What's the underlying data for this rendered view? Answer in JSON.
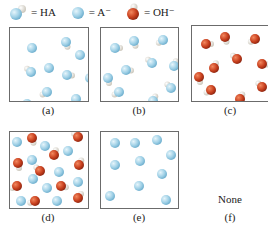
{
  "legend": [
    {
      "symbol": "HA",
      "label": "= HA",
      "icon": "ha-molecule-icon"
    },
    {
      "symbol": "A-",
      "label": "= A⁻",
      "icon": "a-minus-ion-icon"
    },
    {
      "symbol": "OH-",
      "label": "= OH⁻",
      "icon": "hydroxide-ion-icon"
    }
  ],
  "colors": {
    "blue_ion": "#9fd0e6",
    "blue_edge": "#6fb0cf",
    "red_ion": "#c8401e",
    "hydrogen": "#e8e4dc",
    "border": "#6b6b6b"
  },
  "panels": [
    {
      "id": "a",
      "caption": "(a)",
      "contents": "HA molecules and A- ions (mostly HA)",
      "particles": [
        {
          "type": "A-",
          "x": 22,
          "y": 20
        },
        {
          "type": "HA",
          "x": 56,
          "y": 14
        },
        {
          "type": "A-",
          "x": 70,
          "y": 27
        },
        {
          "type": "HA",
          "x": 21,
          "y": 44
        },
        {
          "type": "A-",
          "x": 39,
          "y": 40
        },
        {
          "type": "HA",
          "x": 57,
          "y": 47
        },
        {
          "type": "HA",
          "x": 80,
          "y": 50
        },
        {
          "type": "HA",
          "x": 37,
          "y": 64
        },
        {
          "type": "A-",
          "x": 66,
          "y": 71
        },
        {
          "type": "A-",
          "x": 17,
          "y": 76
        }
      ]
    },
    {
      "id": "b",
      "caption": "(b)",
      "contents": "HA molecules only",
      "particles": [
        {
          "type": "HA",
          "x": 14,
          "y": 20
        },
        {
          "type": "HA",
          "x": 33,
          "y": 13
        },
        {
          "type": "HA",
          "x": 62,
          "y": 12
        },
        {
          "type": "HA",
          "x": 51,
          "y": 35
        },
        {
          "type": "HA",
          "x": 73,
          "y": 38
        },
        {
          "type": "HA",
          "x": 25,
          "y": 42
        },
        {
          "type": "HA",
          "x": 7,
          "y": 50
        },
        {
          "type": "HA",
          "x": 18,
          "y": 64
        },
        {
          "type": "HA",
          "x": 70,
          "y": 60
        },
        {
          "type": "HA",
          "x": 52,
          "y": 73
        }
      ]
    },
    {
      "id": "c",
      "caption": "(c)",
      "contents": "OH- ions only",
      "particles": [
        {
          "type": "OH-",
          "x": 14,
          "y": 18
        },
        {
          "type": "OH-",
          "x": 33,
          "y": 11
        },
        {
          "type": "OH-",
          "x": 63,
          "y": 13
        },
        {
          "type": "OH-",
          "x": 45,
          "y": 33
        },
        {
          "type": "OH-",
          "x": 22,
          "y": 42
        },
        {
          "type": "OH-",
          "x": 70,
          "y": 38
        },
        {
          "type": "OH-",
          "x": 7,
          "y": 51
        },
        {
          "type": "OH-",
          "x": 19,
          "y": 64
        },
        {
          "type": "OH-",
          "x": 70,
          "y": 61
        },
        {
          "type": "OH-",
          "x": 48,
          "y": 73
        }
      ]
    },
    {
      "id": "d",
      "caption": "(d)",
      "contents": "Mixture of A- ions and OH- ions",
      "particles": [
        {
          "type": "A-",
          "x": 7,
          "y": 10
        },
        {
          "type": "OH-",
          "x": 22,
          "y": 6
        },
        {
          "type": "A-",
          "x": 35,
          "y": 14
        },
        {
          "type": "OH-",
          "x": 68,
          "y": 5
        },
        {
          "type": "OH-",
          "x": 44,
          "y": 23
        },
        {
          "type": "A-",
          "x": 58,
          "y": 19
        },
        {
          "type": "OH-",
          "x": 8,
          "y": 31
        },
        {
          "type": "A-",
          "x": 22,
          "y": 28
        },
        {
          "type": "OH-",
          "x": 30,
          "y": 39
        },
        {
          "type": "OH-",
          "x": 69,
          "y": 33
        },
        {
          "type": "A-",
          "x": 49,
          "y": 40
        },
        {
          "type": "A-",
          "x": 23,
          "y": 47
        },
        {
          "type": "OH-",
          "x": 7,
          "y": 54
        },
        {
          "type": "A-",
          "x": 68,
          "y": 50
        },
        {
          "type": "A-",
          "x": 37,
          "y": 56
        },
        {
          "type": "OH-",
          "x": 51,
          "y": 54
        },
        {
          "type": "A-",
          "x": 11,
          "y": 69
        },
        {
          "type": "OH-",
          "x": 25,
          "y": 69
        },
        {
          "type": "A-",
          "x": 47,
          "y": 69
        },
        {
          "type": "OH-",
          "x": 68,
          "y": 66
        }
      ]
    },
    {
      "id": "e",
      "caption": "(e)",
      "contents": "A- ions only",
      "particles": [
        {
          "type": "A-",
          "x": 14,
          "y": 11
        },
        {
          "type": "A-",
          "x": 34,
          "y": 11
        },
        {
          "type": "A-",
          "x": 56,
          "y": 8
        },
        {
          "type": "A-",
          "x": 70,
          "y": 23
        },
        {
          "type": "A-",
          "x": 14,
          "y": 33
        },
        {
          "type": "A-",
          "x": 39,
          "y": 29
        },
        {
          "type": "A-",
          "x": 61,
          "y": 42
        },
        {
          "type": "A-",
          "x": 38,
          "y": 54
        },
        {
          "type": "A-",
          "x": 9,
          "y": 64
        },
        {
          "type": "A-",
          "x": 65,
          "y": 68
        }
      ]
    },
    {
      "id": "f",
      "caption": "(f)",
      "contents": "None",
      "label": "None",
      "particles": []
    }
  ]
}
